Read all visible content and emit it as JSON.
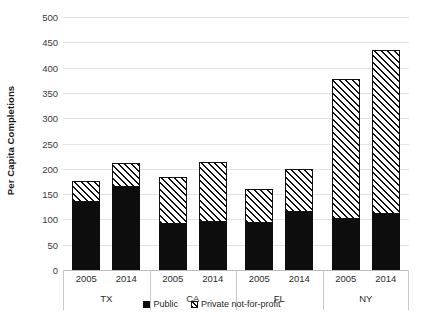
{
  "chart_data": {
    "type": "bar",
    "stacked": true,
    "title": "",
    "xlabel": "",
    "ylabel": "Per Capita Completions",
    "ylim": [
      0,
      500
    ],
    "ytick_step": 50,
    "yticks": [
      500,
      450,
      400,
      350,
      300,
      250,
      200,
      150,
      100,
      50,
      0
    ],
    "ytick_labels": [
      "500",
      "450",
      "400",
      "350",
      "300",
      "250",
      "200",
      "150",
      "100",
      "50",
      "0"
    ],
    "grid": true,
    "grid_axis": "y",
    "legend": [
      "Public",
      "Private not-for-profit"
    ],
    "legend_position": "bottom",
    "groups": [
      "TX",
      "CA",
      "FL",
      "NY"
    ],
    "categories": [
      "2005",
      "2014",
      "2005",
      "2014",
      "2005",
      "2014",
      "2005",
      "2014"
    ],
    "series": [
      {
        "name": "Public",
        "color": "#0d0d0d",
        "fill": "solid",
        "values": [
          135,
          164,
          90,
          95,
          92,
          115,
          100,
          110
        ]
      },
      {
        "name": "Private not-for-profit",
        "color": "#111111",
        "fill": "diagonal-hatch",
        "values": [
          40,
          47,
          93,
          119,
          68,
          85,
          278,
          325
        ]
      }
    ],
    "totals": [
      175,
      211,
      183,
      214,
      160,
      200,
      378,
      435
    ],
    "group_data": [
      {
        "state": "TX",
        "years": [
          {
            "year": "2005",
            "public": 135,
            "private_not_for_profit": 40,
            "total": 175
          },
          {
            "year": "2014",
            "public": 164,
            "private_not_for_profit": 47,
            "total": 211
          }
        ]
      },
      {
        "state": "CA",
        "years": [
          {
            "year": "2005",
            "public": 90,
            "private_not_for_profit": 93,
            "total": 183
          },
          {
            "year": "2014",
            "public": 95,
            "private_not_for_profit": 119,
            "total": 214
          }
        ]
      },
      {
        "state": "FL",
        "years": [
          {
            "year": "2005",
            "public": 92,
            "private_not_for_profit": 68,
            "total": 160
          },
          {
            "year": "2014",
            "public": 115,
            "private_not_for_profit": 85,
            "total": 200
          }
        ]
      },
      {
        "state": "NY",
        "years": [
          {
            "year": "2005",
            "public": 100,
            "private_not_for_profit": 278,
            "total": 378
          },
          {
            "year": "2014",
            "public": 110,
            "private_not_for_profit": 325,
            "total": 435
          }
        ]
      }
    ]
  },
  "axis": {
    "y_title": "Per Capita Completions"
  },
  "legend": {
    "public_label": "Public",
    "private_label": "Private not-for-profit"
  }
}
